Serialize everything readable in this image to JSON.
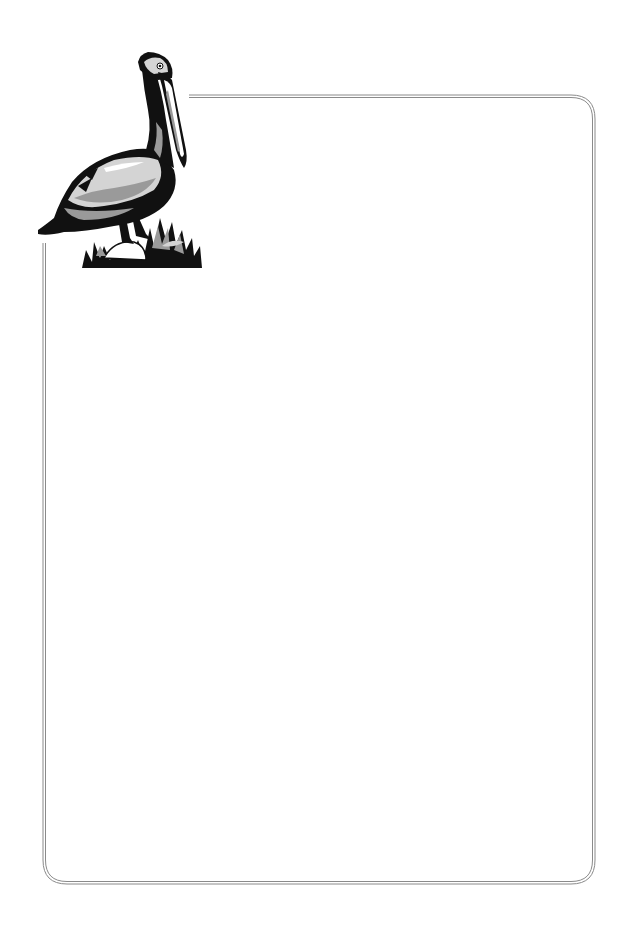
{
  "page": {
    "type": "stationery-letterhead",
    "background": "#ffffff",
    "content_text": ""
  },
  "border": {
    "style": "double-line rounded rectangle",
    "color": "#8a8a8a",
    "corner_radius": 22,
    "left": 44,
    "top": 96,
    "right": 594,
    "bottom": 883
  },
  "illustration": {
    "subject": "pelican-icon",
    "description": "Brown pelican standing on rock with grass, grayscale woodcut clip art",
    "position": "top-left corner, overlapping border"
  },
  "colors": {
    "ink": "#111111",
    "mid_gray": "#9a9a9a",
    "light_gray": "#d4d4d4",
    "white": "#ffffff"
  }
}
